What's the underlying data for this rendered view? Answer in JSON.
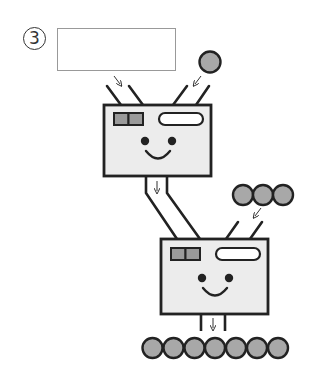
{
  "question": {
    "number_label": "3",
    "answer_box_value": ""
  },
  "colors": {
    "outline": "#222222",
    "machine_fill": "#ececec",
    "ball_fill": "#a8a8a8",
    "indicator_fill": "#9a9a9a",
    "answer_box_border": "#999999"
  },
  "diagram": {
    "machine_1": {
      "inputs": [
        "answer-box",
        "1 ball"
      ],
      "output": "pipe-to-machine-2"
    },
    "machine_2": {
      "inputs": [
        "machine-1-output",
        "3 balls"
      ],
      "output": "7 balls"
    },
    "top_ball_count": 1,
    "side_ball_count": 3,
    "output_ball_count": 7,
    "arrow_glyph": "↓"
  }
}
